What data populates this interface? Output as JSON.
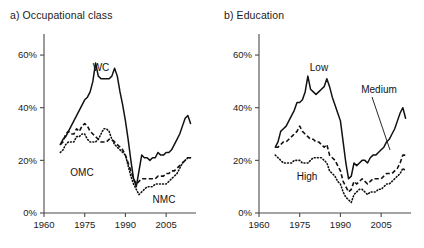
{
  "figure": {
    "panels": [
      {
        "id": "panel-a",
        "title": "a) Occupational class",
        "series_labels": {
          "wc": "WC",
          "omc": "OMC",
          "nmc": "NMC"
        }
      },
      {
        "id": "panel-b",
        "title": "b) Education",
        "series_labels": {
          "low": "Low",
          "medium": "Medium",
          "high": "High"
        }
      }
    ],
    "axis": {
      "y_ticks": [
        "0%",
        "20%",
        "40%",
        "60%"
      ],
      "x_ticks": [
        "1960",
        "1975",
        "1990",
        "2005"
      ]
    }
  },
  "chart_data": [
    {
      "type": "line",
      "title": "a) Occupational class",
      "xlabel": "",
      "ylabel": "",
      "xlim": [
        1960,
        2016
      ],
      "ylim": [
        0,
        68
      ],
      "grid": false,
      "legend_position": "inline-labels",
      "y_ticks": [
        0,
        20,
        40,
        60
      ],
      "y_tick_labels": [
        "0%",
        "20%",
        "40%",
        "60%"
      ],
      "x_ticks": [
        1960,
        1975,
        1990,
        2005
      ],
      "x_tick_labels": [
        "1960",
        "1975",
        "1990",
        "2005"
      ],
      "x": [
        1966,
        1967,
        1968,
        1969,
        1970,
        1971,
        1972,
        1973,
        1974,
        1975,
        1976,
        1977,
        1978,
        1979,
        1980,
        1981,
        1982,
        1983,
        1984,
        1985,
        1986,
        1987,
        1988,
        1989,
        1990,
        1991,
        1992,
        1993,
        1994,
        1995,
        1996,
        1997,
        1998,
        1999,
        2000,
        2001,
        2002,
        2003,
        2004,
        2005,
        2006,
        2007,
        2008,
        2009,
        2010,
        2011,
        2012,
        2013,
        2014
      ],
      "series": [
        {
          "name": "WC",
          "style": "solid",
          "values": [
            26,
            28,
            29,
            31,
            33,
            35,
            37,
            39,
            41,
            43,
            44,
            46,
            50,
            57,
            52,
            51,
            51,
            51,
            51,
            52,
            55,
            52,
            46,
            41,
            35,
            28,
            20,
            13,
            10,
            16,
            22,
            21,
            21,
            20,
            21,
            21,
            23,
            22,
            22,
            23,
            23,
            24,
            26,
            28,
            30,
            33,
            36,
            37,
            34
          ]
        },
        {
          "name": "OMC",
          "style": "dashed",
          "values": [
            26,
            27,
            30,
            31,
            30,
            30,
            32,
            31,
            33,
            34,
            33,
            31,
            30,
            29,
            28,
            27,
            27,
            27,
            28,
            28,
            27,
            26,
            25,
            24,
            22,
            19,
            16,
            13,
            11,
            12,
            13,
            13,
            13,
            13,
            13,
            13,
            14,
            14,
            14,
            15,
            15,
            16,
            16,
            17,
            18,
            19,
            20,
            21,
            21
          ]
        },
        {
          "name": "NMC",
          "style": "dotted",
          "values": [
            23,
            24,
            26,
            27,
            27,
            27,
            29,
            29,
            30,
            30,
            28,
            27,
            27,
            27,
            28,
            30,
            32,
            32,
            31,
            28,
            26,
            25,
            24,
            23,
            22,
            18,
            14,
            11,
            9,
            7,
            8,
            9,
            10,
            10,
            10,
            11,
            11,
            11,
            11,
            11,
            12,
            13,
            14,
            15,
            17,
            19,
            20,
            21,
            21
          ]
        }
      ]
    },
    {
      "type": "line",
      "title": "b) Education",
      "xlabel": "",
      "ylabel": "",
      "xlim": [
        1960,
        2016
      ],
      "ylim": [
        0,
        68
      ],
      "grid": false,
      "legend_position": "inline-labels",
      "y_ticks": [
        0,
        20,
        40,
        60
      ],
      "y_tick_labels": [
        "0%",
        "20%",
        "40%",
        "60%"
      ],
      "x_ticks": [
        1960,
        1975,
        1990,
        2005
      ],
      "x_tick_labels": [
        "1960",
        "1975",
        "1990",
        "2005"
      ],
      "x": [
        1966,
        1967,
        1968,
        1969,
        1970,
        1971,
        1972,
        1973,
        1974,
        1975,
        1976,
        1977,
        1978,
        1979,
        1980,
        1981,
        1982,
        1983,
        1984,
        1985,
        1986,
        1987,
        1988,
        1989,
        1990,
        1991,
        1992,
        1993,
        1994,
        1995,
        1996,
        1997,
        1998,
        1999,
        2000,
        2001,
        2002,
        2003,
        2004,
        2005,
        2006,
        2007,
        2008,
        2009,
        2010,
        2011,
        2012,
        2013,
        2014
      ],
      "series": [
        {
          "name": "Low",
          "style": "solid",
          "values": [
            25,
            27,
            31,
            32,
            33,
            35,
            37,
            39,
            42,
            42,
            43,
            46,
            52,
            47,
            46,
            45,
            46,
            47,
            48,
            51,
            48,
            44,
            41,
            38,
            35,
            27,
            19,
            13,
            14,
            19,
            18,
            19,
            20,
            20,
            19,
            21,
            22,
            22,
            23,
            24,
            25,
            27,
            28,
            30,
            32,
            35,
            38,
            40,
            36
          ]
        },
        {
          "name": "Medium",
          "style": "dashed",
          "values": [
            25,
            25,
            26,
            27,
            27,
            28,
            29,
            30,
            31,
            33,
            31,
            30,
            29,
            28,
            28,
            27,
            27,
            26,
            25,
            26,
            22,
            21,
            20,
            18,
            16,
            12,
            10,
            8,
            9,
            12,
            11,
            12,
            13,
            12,
            11,
            12,
            13,
            13,
            13,
            13,
            14,
            15,
            15,
            15,
            16,
            17,
            19,
            22,
            22
          ]
        },
        {
          "name": "High",
          "style": "dotted",
          "values": [
            22,
            21,
            20,
            19,
            19,
            19,
            19,
            20,
            20,
            20,
            19,
            19,
            19,
            20,
            21,
            21,
            21,
            21,
            20,
            19,
            16,
            15,
            14,
            12,
            11,
            8,
            6,
            5,
            4,
            7,
            8,
            9,
            9,
            8,
            7,
            8,
            8,
            8,
            9,
            9,
            10,
            11,
            11,
            12,
            13,
            14,
            15,
            17,
            16
          ]
        }
      ]
    }
  ]
}
